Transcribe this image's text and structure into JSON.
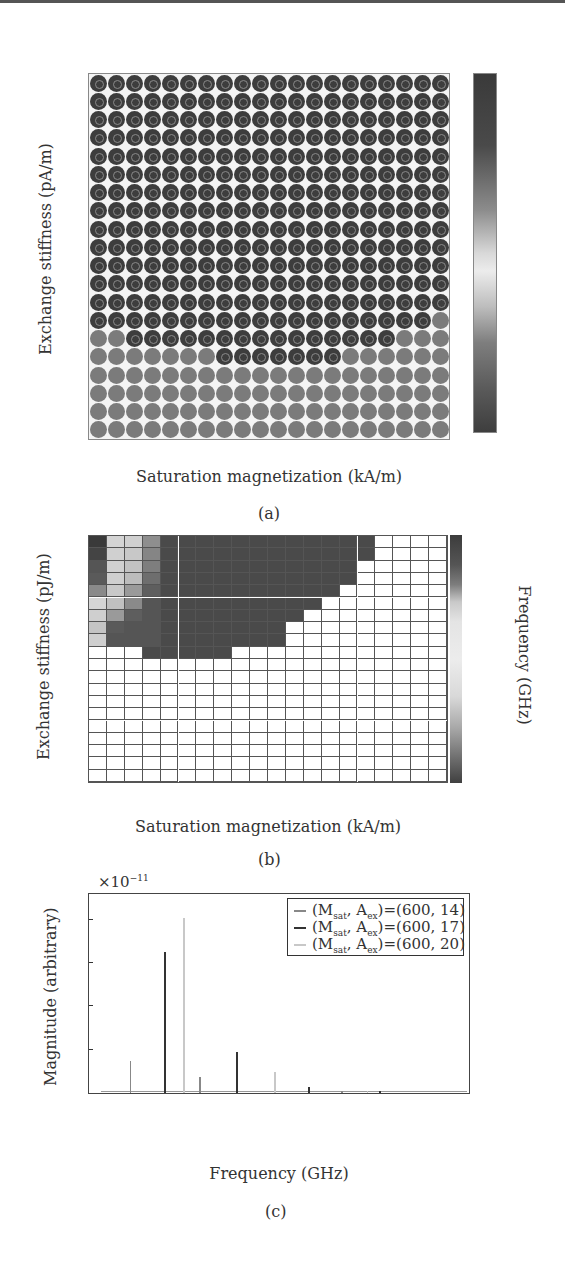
{
  "panels": {
    "a": {
      "caption": "(a)",
      "ylabel": "Exchange stiffness (pA/m)",
      "xlabel": "Saturation magnetization (kA/m)",
      "yticks": [
        "19",
        "17",
        "15",
        "13",
        "11",
        "9",
        "7",
        "5",
        "3",
        "1"
      ],
      "xticks": [
        "50",
        "150",
        "250",
        "350",
        "450",
        "550",
        "650",
        "750",
        "850",
        "950"
      ],
      "colorbar_ticks": [
        "1",
        "0.5",
        "0",
        "−0.5",
        "−1"
      ]
    },
    "b": {
      "caption": "(b)",
      "ylabel": "Exchange stiffness (pJ/m)",
      "xlabel": "Saturation magnetization (kA/m)",
      "yticks": [
        "19",
        "17",
        "15",
        "13",
        "11",
        "9",
        "7",
        "5",
        "3",
        "1"
      ],
      "xticks": [
        "50",
        "150",
        "250",
        "350",
        "450",
        "550",
        "650",
        "750",
        "850",
        "950"
      ],
      "colorbar_label": "Frequency (GHz)",
      "colorbar_ticks": [
        "80",
        "70",
        "60",
        "50",
        "40",
        "30",
        "20",
        "10",
        "0"
      ]
    },
    "c": {
      "caption": "(c)",
      "ylabel": "Magnitude (arbitrary)",
      "xlabel": "Frequency (GHz)",
      "multiplier": "×10",
      "multiplier_exp": "−11",
      "yticks": [
        "8",
        "6",
        "4",
        "2"
      ],
      "xticks": [
        "0",
        "10",
        "20",
        "30"
      ],
      "legend": [
        {
          "prefix": "(M",
          "sub1": "sat",
          "mid": ", A",
          "sub2": "ex",
          "suffix": ")=(600, 14)",
          "color": "#888888"
        },
        {
          "prefix": "(M",
          "sub1": "sat",
          "mid": ", A",
          "sub2": "ex",
          "suffix": ")=(600, 17)",
          "color": "#333333"
        },
        {
          "prefix": "(M",
          "sub1": "sat",
          "mid": ", A",
          "sub2": "ex",
          "suffix": ")=(600, 20)",
          "color": "#c8c8c8"
        }
      ]
    }
  },
  "chart_data": [
    {
      "type": "heatmap",
      "title": "(a)",
      "xlabel": "Saturation magnetization (kA/m)",
      "ylabel": "Exchange stiffness (pA/m)",
      "x": [
        50,
        100,
        150,
        200,
        250,
        300,
        350,
        400,
        450,
        500,
        550,
        600,
        650,
        700,
        750,
        800,
        850,
        900,
        950,
        1000
      ],
      "y": [
        1,
        2,
        3,
        4,
        5,
        6,
        7,
        8,
        9,
        10,
        11,
        12,
        13,
        14,
        15,
        16,
        17,
        18,
        19,
        20
      ],
      "colorbar_range": [
        -1,
        1
      ],
      "note": "Rows 8-20: all high (~1, dark with ring). Row 7: cols 1-19 high, col 20 low. Row 6: cols 3-17 high. Row 5: cols 8-14 high. Rows 1-4 and remaining cells low (~-0.7).",
      "high_cells_by_row": {
        "20": [
          1,
          20
        ],
        "19": [
          1,
          20
        ],
        "18": [
          1,
          20
        ],
        "17": [
          1,
          20
        ],
        "16": [
          1,
          20
        ],
        "15": [
          1,
          20
        ],
        "14": [
          1,
          20
        ],
        "13": [
          1,
          20
        ],
        "12": [
          1,
          20
        ],
        "11": [
          1,
          20
        ],
        "10": [
          1,
          20
        ],
        "9": [
          1,
          20
        ],
        "8": [
          1,
          20
        ],
        "7": [
          1,
          19
        ],
        "6": [
          3,
          17
        ],
        "5": [
          8,
          14
        ]
      },
      "high_value": 1,
      "low_value": -0.7
    },
    {
      "type": "heatmap",
      "title": "(b)",
      "xlabel": "Saturation magnetization (kA/m)",
      "ylabel": "Exchange stiffness (pJ/m)",
      "colorbar_label": "Frequency (GHz)",
      "colorbar_range": [
        0,
        85
      ],
      "x": [
        50,
        100,
        150,
        200,
        250,
        300,
        350,
        400,
        450,
        500,
        550,
        600,
        650,
        700,
        750,
        800,
        850,
        900,
        950,
        1000
      ],
      "y": [
        1,
        2,
        3,
        4,
        5,
        6,
        7,
        8,
        9,
        10,
        11,
        12,
        13,
        14,
        15,
        16,
        17,
        18,
        19,
        20
      ],
      "note": "White cells = no value. Colored region in upper-left staircase.",
      "colored_ranges_by_row": {
        "20": [
          1,
          16
        ],
        "19": [
          1,
          16
        ],
        "18": [
          1,
          15
        ],
        "17": [
          1,
          15
        ],
        "16": [
          1,
          14
        ],
        "15": [
          1,
          13
        ],
        "14": [
          1,
          12
        ],
        "13": [
          1,
          11
        ],
        "12": [
          1,
          11
        ],
        "11": [
          4,
          8
        ]
      },
      "left_columns_grey": {
        "col1": {
          "20": "#3a3a3a",
          "19": "#444",
          "18": "#555",
          "17": "#5a5a5a",
          "16": "#8a8a8a",
          "15": "#d5d5d5",
          "14": "#cfcfcf",
          "13": "#c4c4c4",
          "12": "#cfcfcf"
        },
        "col2": {
          "20": "#d4d4d4",
          "19": "#d0d0d0",
          "18": "#d0d0d0",
          "17": "#cfcfcf",
          "16": "#c8c8c8",
          "15": "#c0c0c0",
          "14": "#9a9a9a",
          "13": "#5a5a5a",
          "12": "#555"
        },
        "col3": {
          "20": "#d0d0d0",
          "19": "#c8c8c8",
          "18": "#c2c2c2",
          "17": "#bcbcbc",
          "16": "#9a9a9a",
          "15": "#8a8a8a",
          "14": "#5e5e5e",
          "13": "#555",
          "12": "#555"
        },
        "col4": {
          "20": "#8e8e8e",
          "19": "#858585",
          "18": "#7e7e7e",
          "17": "#6e6e6e",
          "16": "#5e5e5e",
          "15": "#555",
          "14": "#555",
          "13": "#555",
          "12": "#555"
        }
      },
      "typical_colored_value_GHz": 80
    },
    {
      "type": "line",
      "title": "(c)",
      "xlabel": "Frequency (GHz)",
      "ylabel": "Magnitude (arbitrary)",
      "y_multiplier": "1e-11",
      "xlim": [
        0,
        30
      ],
      "ylim": [
        0,
        9
      ],
      "xticks": [
        0,
        10,
        20,
        30
      ],
      "yticks": [
        2,
        4,
        6,
        8
      ],
      "legend_position": "upper right",
      "series": [
        {
          "name": "(M_sat, A_ex)=(600, 14)",
          "color": "#888888",
          "peaks": [
            {
              "x": 3.3,
              "y": 1.5
            },
            {
              "x": 8.8,
              "y": 0.75
            },
            {
              "x": 14.7,
              "y": 0.2
            },
            {
              "x": 20.0,
              "y": 0.1
            }
          ]
        },
        {
          "name": "(M_sat, A_ex)=(600, 17)",
          "color": "#333333",
          "peaks": [
            {
              "x": 6.0,
              "y": 6.5
            },
            {
              "x": 11.7,
              "y": 1.9
            },
            {
              "x": 17.4,
              "y": 0.3
            },
            {
              "x": 23.0,
              "y": 0.05
            }
          ]
        },
        {
          "name": "(M_sat, A_ex)=(600, 20)",
          "color": "#c8c8c8",
          "peaks": [
            {
              "x": 7.5,
              "y": 8.1
            },
            {
              "x": 14.7,
              "y": 0.95
            },
            {
              "x": 22.0,
              "y": 0.05
            }
          ]
        }
      ]
    }
  ]
}
